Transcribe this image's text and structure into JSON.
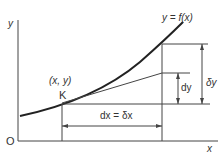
{
  "diagram": {
    "axes": {
      "y_label": "y",
      "x_label": "x",
      "origin_label": "O"
    },
    "curve_label": "y = f(x)",
    "point": {
      "coord_label": "(x, y)",
      "name": "K"
    },
    "increments": {
      "dx_label": "dx = δx",
      "dy_label": "dy",
      "delta_y_label": "δy"
    }
  }
}
